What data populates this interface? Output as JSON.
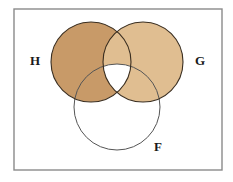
{
  "figure": {
    "type": "venn-diagram",
    "width": 233,
    "height": 182,
    "background_color": "#FFFFFF",
    "frame": {
      "name": "universal-set-rectangle",
      "x": 14,
      "y": 9,
      "width": 208,
      "height": 161,
      "stroke_color": "#8A8A8A",
      "stroke_width": 1.4,
      "fill": "none"
    }
  },
  "sets": [
    {
      "id": "H",
      "label": "H",
      "cx": 91,
      "cy": 62,
      "r": 40,
      "fill_color": "#C89A68",
      "stroke_color": "#3A2E20",
      "stroke_width": 1.1,
      "filled": true,
      "label_x": 35,
      "label_y": 62
    },
    {
      "id": "G",
      "label": "G",
      "cx": 143,
      "cy": 62,
      "r": 40,
      "fill_color": "#E0BE91",
      "stroke_color": "#3A2E20",
      "stroke_width": 1.1,
      "filled": true,
      "label_x": 200,
      "label_y": 62
    },
    {
      "id": "F",
      "label": "F",
      "cx": 117,
      "cy": 107,
      "r": 43,
      "fill_color": "none",
      "stroke_color": "#555555",
      "stroke_width": 1.0,
      "filled": false,
      "label_x": 158,
      "label_y": 148
    }
  ],
  "shaded_description": {
    "shaded_regions": [
      "H only",
      "G only",
      "H and G but not F",
      "H and F but not G",
      "G and F but not H"
    ],
    "unshaded_regions": [
      "H and G and F",
      "F only",
      "outside all sets"
    ]
  },
  "colors": {
    "h_fill": "#C89A68",
    "g_fill": "#E0BE91",
    "circle_outline": "#3A2E20",
    "f_outline": "#555555",
    "frame_stroke": "#8A8A8A",
    "label_text": "#1A1A1A",
    "page_background": "#FFFFFF"
  }
}
